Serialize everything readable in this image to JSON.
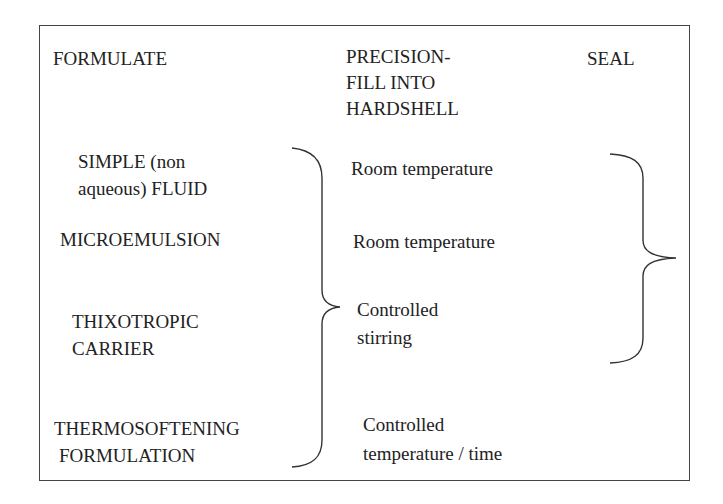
{
  "headers": {
    "formulate": "FORMULATE",
    "fill": [
      "PRECISION-",
      "FILL INTO",
      "HARDSHELL"
    ],
    "seal": "SEAL"
  },
  "formulations": [
    {
      "lines": [
        "SIMPLE (non",
        "aqueous) FLUID"
      ]
    },
    {
      "lines": [
        "MICROEMULSION"
      ]
    },
    {
      "lines": [
        "THIXOTROPIC",
        "CARRIER"
      ]
    },
    {
      "lines": [
        "THERMOSOFTENING",
        "FORMULATION"
      ]
    }
  ],
  "fill_conditions": [
    {
      "lines": [
        "Room temperature"
      ]
    },
    {
      "lines": [
        "Room temperature"
      ]
    },
    {
      "lines": [
        "Controlled",
        "stirring"
      ]
    },
    {
      "lines": [
        "Controlled",
        "temperature / time"
      ]
    }
  ]
}
